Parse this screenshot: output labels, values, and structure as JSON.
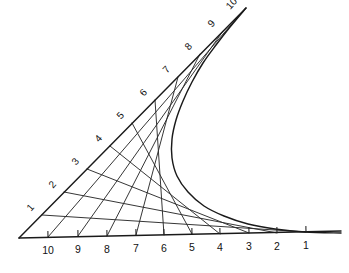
{
  "figure": {
    "background_color": "#ffffff",
    "line_color": "#2b2b2b",
    "axis_color": "#1a1a1a",
    "label_color": "#111111",
    "width": 349,
    "height": 273
  },
  "chart_data": {
    "type": "line",
    "subtitle": "",
    "xlabel": "",
    "ylabel": "",
    "grid": false,
    "legend": null,
    "vertex": {
      "x": 19,
      "y": 238
    },
    "rays": [
      {
        "name": "horizontal-ray",
        "description": "Lower ray running to the right from the vertex; graduations numbered 10 nearest the vertex down to 1 farthest away.",
        "start": {
          "x": 19,
          "y": 238
        },
        "end": {
          "x": 341,
          "y": 231
        },
        "tick_labels": [
          "10",
          "9",
          "8",
          "7",
          "6",
          "5",
          "4",
          "3",
          "2",
          "1"
        ],
        "tick_points": [
          {
            "label": "10",
            "x": 48,
            "y": 237
          },
          {
            "label": "9",
            "x": 78,
            "y": 236
          },
          {
            "label": "8",
            "x": 107,
            "y": 236
          },
          {
            "label": "7",
            "x": 136,
            "y": 235
          },
          {
            "label": "6",
            "x": 164,
            "y": 235
          },
          {
            "label": "5",
            "x": 192,
            "y": 234
          },
          {
            "label": "4",
            "x": 220,
            "y": 234
          },
          {
            "label": "3",
            "x": 249,
            "y": 233
          },
          {
            "label": "2",
            "x": 277,
            "y": 233
          },
          {
            "label": "1",
            "x": 306,
            "y": 232
          }
        ],
        "label_offset": {
          "dx": 0,
          "dy": 14
        },
        "label_rotation": 0
      },
      {
        "name": "diagonal-ray",
        "description": "Upper ray rising to the right from the vertex; graduations numbered 1 nearest the vertex up to 10 farthest away.",
        "start": {
          "x": 19,
          "y": 238
        },
        "end": {
          "x": 246,
          "y": 8
        },
        "tick_labels": [
          "1",
          "2",
          "3",
          "4",
          "5",
          "6",
          "7",
          "8",
          "9",
          "10"
        ],
        "tick_points": [
          {
            "label": "1",
            "x": 42,
            "y": 215
          },
          {
            "label": "2",
            "x": 64,
            "y": 192
          },
          {
            "label": "3",
            "x": 87,
            "y": 169
          },
          {
            "label": "4",
            "x": 110,
            "y": 146
          },
          {
            "label": "5",
            "x": 132,
            "y": 123
          },
          {
            "label": "6",
            "x": 155,
            "y": 100
          },
          {
            "label": "7",
            "x": 178,
            "y": 77
          },
          {
            "label": "8",
            "x": 200,
            "y": 54
          },
          {
            "label": "9",
            "x": 223,
            "y": 31
          },
          {
            "label": "10",
            "x": 243,
            "y": 11
          }
        ],
        "label_offset": {
          "dx": -11,
          "dy": -7
        },
        "label_rotation": -48
      }
    ],
    "chords": [
      {
        "name": "chord-1",
        "from_ray": "diagonal",
        "from_index": 1,
        "to_ray": "horizontal",
        "to_index": 1,
        "x1": 42,
        "y1": 215,
        "x2": 306,
        "y2": 232
      },
      {
        "name": "chord-2",
        "from_ray": "diagonal",
        "from_index": 2,
        "to_ray": "horizontal",
        "to_index": 2,
        "x1": 64,
        "y1": 192,
        "x2": 277,
        "y2": 233
      },
      {
        "name": "chord-3",
        "from_ray": "diagonal",
        "from_index": 3,
        "to_ray": "horizontal",
        "to_index": 3,
        "x1": 87,
        "y1": 169,
        "x2": 249,
        "y2": 233
      },
      {
        "name": "chord-4",
        "from_ray": "diagonal",
        "from_index": 4,
        "to_ray": "horizontal",
        "to_index": 4,
        "x1": 110,
        "y1": 146,
        "x2": 220,
        "y2": 234
      },
      {
        "name": "chord-5",
        "from_ray": "diagonal",
        "from_index": 5,
        "to_ray": "horizontal",
        "to_index": 5,
        "x1": 132,
        "y1": 123,
        "x2": 192,
        "y2": 234
      },
      {
        "name": "chord-6",
        "from_ray": "diagonal",
        "from_index": 6,
        "to_ray": "horizontal",
        "to_index": 6,
        "x1": 155,
        "y1": 100,
        "x2": 164,
        "y2": 235
      },
      {
        "name": "chord-7",
        "from_ray": "diagonal",
        "from_index": 7,
        "to_ray": "horizontal",
        "to_index": 7,
        "x1": 178,
        "y1": 77,
        "x2": 136,
        "y2": 235
      },
      {
        "name": "chord-8",
        "from_ray": "diagonal",
        "from_index": 8,
        "to_ray": "horizontal",
        "to_index": 8,
        "x1": 200,
        "y1": 54,
        "x2": 107,
        "y2": 236
      },
      {
        "name": "chord-9",
        "from_ray": "diagonal",
        "from_index": 9,
        "to_ray": "horizontal",
        "to_index": 9,
        "x1": 223,
        "y1": 31,
        "x2": 78,
        "y2": 236
      },
      {
        "name": "chord-10",
        "from_ray": "diagonal",
        "from_index": 10,
        "to_ray": "horizontal",
        "to_index": 10,
        "x1": 243,
        "y1": 11,
        "x2": 48,
        "y2": 237
      }
    ],
    "envelope": {
      "name": "parabolic-envelope",
      "description": "Smooth curve tangent to every chord, sweeping from the upper right of the diagonal ray down past the waist and out along the horizontal ray to the right.",
      "points": [
        {
          "x": 246,
          "y": 8
        },
        {
          "x": 230,
          "y": 27
        },
        {
          "x": 216,
          "y": 45
        },
        {
          "x": 203,
          "y": 63
        },
        {
          "x": 192,
          "y": 82
        },
        {
          "x": 183,
          "y": 101
        },
        {
          "x": 176,
          "y": 120
        },
        {
          "x": 172,
          "y": 139
        },
        {
          "x": 172,
          "y": 158
        },
        {
          "x": 177,
          "y": 176
        },
        {
          "x": 188,
          "y": 192
        },
        {
          "x": 204,
          "y": 206
        },
        {
          "x": 224,
          "y": 216
        },
        {
          "x": 248,
          "y": 224
        },
        {
          "x": 275,
          "y": 229
        },
        {
          "x": 305,
          "y": 232
        },
        {
          "x": 341,
          "y": 233
        }
      ]
    }
  }
}
